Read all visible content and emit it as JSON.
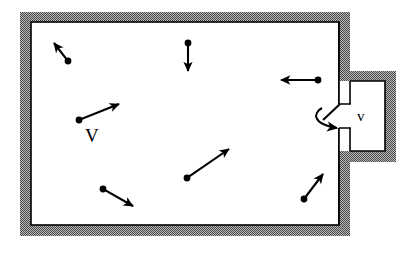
{
  "figure": {
    "domain": "Diagram",
    "kind": "physics-schematic",
    "width": 413,
    "height": 253,
    "background_color": "#ffffff",
    "ink_color": "#000000",
    "wall_fill_color": "#9a9a9a",
    "wall_hatch_color": "#3a3a3a",
    "interior_color": "#ffffff"
  },
  "labels": {
    "main_volume": "V",
    "side_volume": "v"
  },
  "main_chamber": {
    "name": "main-gas-container",
    "outer": {
      "x": 20,
      "y": 12,
      "width": 330,
      "height": 224
    },
    "inner": {
      "x": 31,
      "y": 22,
      "width": 308,
      "height": 203
    },
    "wall_thickness": 10
  },
  "side_chamber": {
    "name": "side-chamber",
    "outer": {
      "x": 339,
      "y": 71,
      "width": 57,
      "height": 91
    },
    "inner": {
      "x": 350,
      "y": 81,
      "width": 35,
      "height": 70
    },
    "wall_thickness": 11
  },
  "aperture": {
    "name": "wall-opening",
    "x": 339,
    "y": 104,
    "width": 12,
    "height": 24,
    "note": "gap in the shared wall connecting volume V to volume v"
  },
  "effusion_arrow": {
    "name": "effusion-curved-arrow",
    "straight_segment": {
      "x1": 340,
      "y1": 104,
      "x2": 323,
      "y2": 120
    },
    "curve": {
      "start_x": 322,
      "start_y": 108,
      "end_x": 337,
      "end_y": 128
    },
    "head_angle_deg": 35
  },
  "molecules": [
    {
      "id": 1,
      "name": "molecule-top-left",
      "dot_x": 68,
      "dot_y": 61,
      "tip_x": 54,
      "tip_y": 43,
      "direction": "up-left",
      "speed_px": 23
    },
    {
      "id": 2,
      "name": "molecule-top-center",
      "dot_x": 188,
      "dot_y": 43,
      "tip_x": 188,
      "tip_y": 71,
      "direction": "down",
      "speed_px": 28
    },
    {
      "id": 3,
      "name": "molecule-top-right",
      "dot_x": 318,
      "dot_y": 80,
      "tip_x": 281,
      "tip_y": 80,
      "direction": "left",
      "speed_px": 37
    },
    {
      "id": 4,
      "name": "molecule-mid-left",
      "dot_x": 79,
      "dot_y": 120,
      "tip_x": 119,
      "tip_y": 104,
      "direction": "up-right",
      "speed_px": 43
    },
    {
      "id": 5,
      "name": "molecule-center",
      "dot_x": 187,
      "dot_y": 178,
      "tip_x": 229,
      "tip_y": 149,
      "direction": "up-right",
      "speed_px": 51
    },
    {
      "id": 6,
      "name": "molecule-bottom-left",
      "dot_x": 103,
      "dot_y": 189,
      "tip_x": 133,
      "tip_y": 206,
      "direction": "down-right",
      "speed_px": 35
    },
    {
      "id": 7,
      "name": "molecule-bottom-right",
      "dot_x": 304,
      "dot_y": 199,
      "tip_x": 323,
      "tip_y": 174,
      "direction": "up-right",
      "speed_px": 31
    }
  ],
  "dot_radius": 3.4,
  "vector_line_width": 2.1
}
